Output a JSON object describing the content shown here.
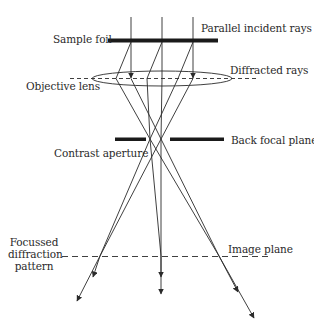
{
  "diagram": {
    "type": "ray-diagram",
    "labels": {
      "parallel_incident_rays": "Parallel incident rays",
      "sample_foil": "Sample foil",
      "diffracted_rays": "Diffracted rays",
      "objective_lens": "Objective lens",
      "back_focal_plane": "Back focal plane",
      "contrast_aperture": "Contrast aperture",
      "focussed_diffraction_pattern_1": "Focussed",
      "focussed_diffraction_pattern_2": "diffraction",
      "focussed_diffraction_pattern_3": "pattern",
      "image_plane": "Image plane"
    },
    "colors": {
      "line": "#2a2a2a",
      "bar": "#1a1a1a",
      "background": "#ffffff"
    }
  }
}
